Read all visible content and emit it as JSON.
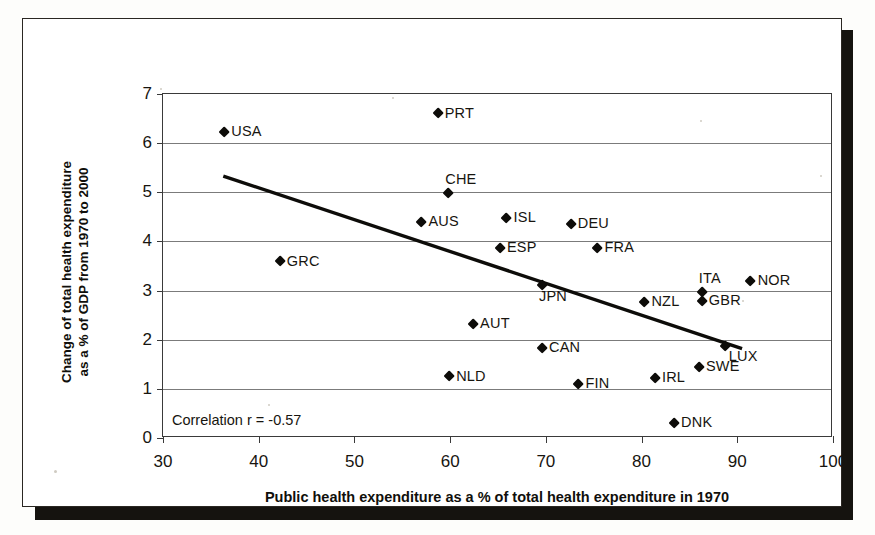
{
  "chart_data": {
    "type": "scatter",
    "title": "",
    "xlabel": "Public health expenditure as a % of total health expenditure in 1970",
    "ylabel_line1": "Change of total health expenditure",
    "ylabel_line2": "as a % of GDP from 1970 to 2000",
    "xlim": [
      30,
      100
    ],
    "ylim": [
      0,
      7
    ],
    "xticks": [
      30,
      40,
      50,
      60,
      70,
      80,
      90,
      100
    ],
    "yticks": [
      0,
      1,
      2,
      3,
      4,
      5,
      6,
      7
    ],
    "grid": "horizontal",
    "legend": "none",
    "annotation": "Correlation r = -0.57",
    "correlation": -0.57,
    "trendline": {
      "x0": 36.3,
      "y0": 5.33,
      "x1": 90.5,
      "y1": 1.82
    },
    "points": [
      {
        "label": "USA",
        "x": 36.4,
        "y": 6.22,
        "label_pos": "right"
      },
      {
        "label": "PRT",
        "x": 58.7,
        "y": 6.6,
        "label_pos": "right"
      },
      {
        "label": "CHE",
        "x": 59.8,
        "y": 4.98,
        "label_pos": "above"
      },
      {
        "label": "AUS",
        "x": 57.0,
        "y": 4.4,
        "label_pos": "right"
      },
      {
        "label": "ISL",
        "x": 65.9,
        "y": 4.48,
        "label_pos": "right"
      },
      {
        "label": "DEU",
        "x": 72.6,
        "y": 4.35,
        "label_pos": "right"
      },
      {
        "label": "ESP",
        "x": 65.2,
        "y": 3.87,
        "label_pos": "right"
      },
      {
        "label": "FRA",
        "x": 75.4,
        "y": 3.86,
        "label_pos": "right"
      },
      {
        "label": "GRC",
        "x": 42.2,
        "y": 3.59,
        "label_pos": "right"
      },
      {
        "label": "NOR",
        "x": 91.4,
        "y": 3.2,
        "label_pos": "right"
      },
      {
        "label": "ITA",
        "x": 86.3,
        "y": 2.97,
        "label_pos": "above"
      },
      {
        "label": "JPN",
        "x": 69.6,
        "y": 3.1,
        "label_pos": "below"
      },
      {
        "label": "GBR",
        "x": 86.3,
        "y": 2.78,
        "label_pos": "right"
      },
      {
        "label": "NZL",
        "x": 80.3,
        "y": 2.76,
        "label_pos": "right"
      },
      {
        "label": "AUT",
        "x": 62.4,
        "y": 2.32,
        "label_pos": "right"
      },
      {
        "label": "CAN",
        "x": 69.6,
        "y": 1.83,
        "label_pos": "right"
      },
      {
        "label": "LUX",
        "x": 88.7,
        "y": 1.86,
        "label_pos": "belowr"
      },
      {
        "label": "SWE",
        "x": 86.0,
        "y": 1.44,
        "label_pos": "right"
      },
      {
        "label": "IRL",
        "x": 81.4,
        "y": 1.22,
        "label_pos": "right"
      },
      {
        "label": "NLD",
        "x": 59.9,
        "y": 1.25,
        "label_pos": "right"
      },
      {
        "label": "FIN",
        "x": 73.4,
        "y": 1.1,
        "label_pos": "right"
      },
      {
        "label": "DNK",
        "x": 83.4,
        "y": 0.3,
        "label_pos": "right"
      }
    ]
  },
  "colors": {
    "marker": "#0d0c09",
    "trendline": "#0d0c09",
    "gridline": "#7b7b7b",
    "axis": "#3a3a3a",
    "paper": "#ffffff",
    "shadow": "#15130f"
  }
}
